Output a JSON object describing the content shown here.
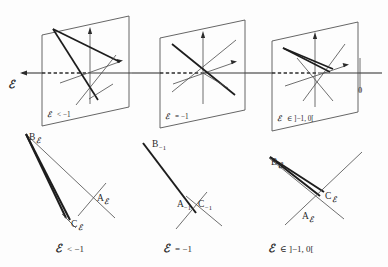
{
  "figure": {
    "axis": {
      "parameter_symbol": "D",
      "parameter_label": "ℰ",
      "origin_tick_label": "0",
      "direction": "leftward arrow",
      "description": "Horizontal parameter axis with arrowhead at left, dashed segments between planes, vertical tick at right marked 0"
    },
    "top_row": {
      "panels": [
        {
          "id": "panel-plane-1",
          "caption_symbol": "ℰ",
          "caption_relation": "< −1",
          "caption_full": "ℰ < −1",
          "shape": "plane",
          "note": "Three lines and two axes inside a tilted plane; lines form a small open triangle"
        },
        {
          "id": "panel-plane-2",
          "caption_symbol": "ℰ",
          "caption_relation": "= −1",
          "caption_full": "ℰ = −1",
          "shape": "plane",
          "note": "All lines concurrent at a single point inside the plane"
        },
        {
          "id": "panel-plane-3",
          "caption_symbol": "ℰ",
          "caption_relation": "∈ ]−1, 0[",
          "caption_full": "ℰ ∈ ]−1,0[",
          "shape": "plane",
          "note": "Lines form a small triangle on the opposite orientation inside the plane"
        }
      ]
    },
    "bottom_row": {
      "panels": [
        {
          "id": "panel-triangle-1",
          "caption_symbol": "ℰ",
          "caption_relation": "< −1",
          "caption_full": "ℰ < −1",
          "vertices": [
            {
              "name": "B",
              "subscript": "ℰ",
              "label": "B",
              "position": "top-left"
            },
            {
              "name": "A",
              "subscript": "ℰ",
              "label": "A",
              "position": "mid-right"
            },
            {
              "name": "C",
              "subscript": "ℰ",
              "label": "C",
              "position": "bottom"
            }
          ],
          "note": "Very thin elongated triangle"
        },
        {
          "id": "panel-triangle-2",
          "caption_symbol": "ℰ",
          "caption_relation": "= −1",
          "caption_full": "ℰ = −1",
          "vertices": [
            {
              "name": "B",
              "subscript": "−1",
              "label": "B",
              "position": "top-left"
            },
            {
              "name": "A",
              "subscript": "−1",
              "label": "A",
              "position": "center-left"
            },
            {
              "name": "C",
              "subscript": "−1",
              "label": "C",
              "position": "center-right"
            }
          ],
          "note": "Degenerate triangle collapsed onto a single line"
        },
        {
          "id": "panel-triangle-3",
          "caption_symbol": "ℰ",
          "caption_relation": "∈ ]−1, 0[",
          "caption_full": "ℰ ∈ ]−1,0[",
          "vertices": [
            {
              "name": "B",
              "subscript": "ℰ",
              "label": "B",
              "position": "top-left"
            },
            {
              "name": "C",
              "subscript": "ℰ",
              "label": "C",
              "position": "right"
            },
            {
              "name": "A",
              "subscript": "ℰ",
              "label": "A",
              "position": "bottom-center"
            }
          ],
          "note": "Thin triangle reopened with reversed orientation"
        }
      ]
    },
    "colors": {
      "background": "#fdfdfd",
      "ink": "#2a2a2a",
      "light_ink": "#4a4a4a",
      "bold_ink": "#1d1d1d"
    }
  }
}
